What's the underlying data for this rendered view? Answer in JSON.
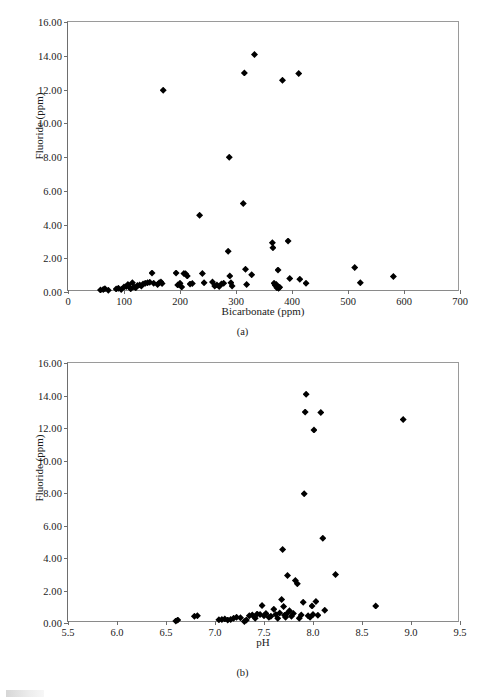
{
  "figure": {
    "panels": [
      {
        "id": "a",
        "caption": "(a)",
        "ylabel": "Fluoride (ppm)",
        "xlabel": "Bicarbonate (ppm)"
      },
      {
        "id": "b",
        "caption": "(b)",
        "ylabel": "Fluoride (ppm)",
        "xlabel": "pH"
      }
    ]
  },
  "chart_data": [
    {
      "type": "scatter",
      "panel": "a",
      "title": "",
      "xlabel": "Bicarbonate (ppm)",
      "ylabel": "Fluoride (ppm)",
      "xlim": [
        0,
        700
      ],
      "ylim": [
        0,
        16
      ],
      "xticks": [
        0,
        100,
        200,
        300,
        400,
        500,
        600,
        700
      ],
      "xtick_labels": [
        "0",
        "100",
        "200",
        "300",
        "400",
        "500",
        "600",
        "700"
      ],
      "yticks": [
        0,
        2,
        4,
        6,
        8,
        10,
        12,
        14,
        16
      ],
      "ytick_labels": [
        "0.00",
        "2.00",
        "4.00",
        "6.00",
        "8.00",
        "10.00",
        "12.00",
        "14.00",
        "16.00"
      ],
      "grid": false,
      "legend": false,
      "marker": "diamond",
      "marker_color": "#000000",
      "points": [
        [
          58,
          0.12
        ],
        [
          63,
          0.15
        ],
        [
          66,
          0.2
        ],
        [
          72,
          0.1
        ],
        [
          86,
          0.18
        ],
        [
          90,
          0.22
        ],
        [
          95,
          0.15
        ],
        [
          100,
          0.3
        ],
        [
          104,
          0.32
        ],
        [
          107,
          0.45
        ],
        [
          110,
          0.28
        ],
        [
          112,
          0.2
        ],
        [
          115,
          0.55
        ],
        [
          118,
          0.3
        ],
        [
          121,
          0.25
        ],
        [
          124,
          0.38
        ],
        [
          128,
          0.42
        ],
        [
          131,
          0.35
        ],
        [
          134,
          0.48
        ],
        [
          138,
          0.52
        ],
        [
          142,
          0.55
        ],
        [
          146,
          0.58
        ],
        [
          150,
          1.12
        ],
        [
          153,
          0.52
        ],
        [
          160,
          0.45
        ],
        [
          163,
          0.55
        ],
        [
          166,
          0.6
        ],
        [
          168,
          0.5
        ],
        [
          170,
          11.95
        ],
        [
          193,
          1.12
        ],
        [
          196,
          0.42
        ],
        [
          200,
          0.52
        ],
        [
          203,
          0.3
        ],
        [
          207,
          1.1
        ],
        [
          210,
          1.08
        ],
        [
          213,
          0.95
        ],
        [
          218,
          0.47
        ],
        [
          222,
          0.5
        ],
        [
          235,
          4.55
        ],
        [
          240,
          1.1
        ],
        [
          243,
          0.55
        ],
        [
          258,
          0.6
        ],
        [
          262,
          0.35
        ],
        [
          266,
          0.42
        ],
        [
          270,
          0.33
        ],
        [
          274,
          0.48
        ],
        [
          278,
          0.52
        ],
        [
          286,
          2.42
        ],
        [
          288,
          7.98
        ],
        [
          289,
          0.95
        ],
        [
          291,
          0.55
        ],
        [
          293,
          0.35
        ],
        [
          313,
          5.25
        ],
        [
          315,
          12.98
        ],
        [
          317,
          1.35
        ],
        [
          319,
          0.45
        ],
        [
          328,
          1.02
        ],
        [
          333,
          14.07
        ],
        [
          365,
          2.92
        ],
        [
          366,
          2.62
        ],
        [
          368,
          0.52
        ],
        [
          370,
          0.4
        ],
        [
          372,
          0.45
        ],
        [
          373,
          0.25
        ],
        [
          374,
          0.3
        ],
        [
          375,
          1.3
        ],
        [
          376,
          0.22
        ],
        [
          378,
          0.28
        ],
        [
          383,
          12.55
        ],
        [
          393,
          3.02
        ],
        [
          396,
          0.8
        ],
        [
          412,
          12.95
        ],
        [
          414,
          0.75
        ],
        [
          425,
          0.52
        ],
        [
          512,
          1.45
        ],
        [
          522,
          0.55
        ],
        [
          581,
          0.92
        ]
      ]
    },
    {
      "type": "scatter",
      "panel": "b",
      "title": "",
      "xlabel": "pH",
      "ylabel": "Fluoride (ppm)",
      "xlim": [
        5.5,
        9.5
      ],
      "ylim": [
        0,
        16
      ],
      "xticks": [
        5.5,
        6.0,
        6.5,
        7.0,
        7.5,
        8.0,
        8.5,
        9.0,
        9.5
      ],
      "xtick_labels": [
        "5.5",
        "6.0",
        "6.5",
        "7.0",
        "7.5",
        "8.0",
        "8.5",
        "9.0",
        "9.5"
      ],
      "yticks": [
        0,
        2,
        4,
        6,
        8,
        10,
        12,
        14,
        16
      ],
      "ytick_labels": [
        "0.00",
        "2.00",
        "4.00",
        "6.00",
        "8.00",
        "10.00",
        "12.00",
        "14.00",
        "16.00"
      ],
      "grid": false,
      "legend": false,
      "marker": "diamond",
      "marker_color": "#000000",
      "points": [
        [
          6.6,
          0.12
        ],
        [
          6.62,
          0.18
        ],
        [
          6.79,
          0.42
        ],
        [
          6.82,
          0.45
        ],
        [
          7.04,
          0.2
        ],
        [
          7.07,
          0.22
        ],
        [
          7.1,
          0.25
        ],
        [
          7.13,
          0.18
        ],
        [
          7.16,
          0.22
        ],
        [
          7.19,
          0.3
        ],
        [
          7.22,
          0.35
        ],
        [
          7.26,
          0.32
        ],
        [
          7.3,
          0.1
        ],
        [
          7.32,
          0.18
        ],
        [
          7.35,
          0.45
        ],
        [
          7.38,
          0.5
        ],
        [
          7.41,
          0.3
        ],
        [
          7.43,
          0.55
        ],
        [
          7.46,
          0.52
        ],
        [
          7.48,
          1.08
        ],
        [
          7.5,
          0.45
        ],
        [
          7.52,
          0.58
        ],
        [
          7.55,
          0.35
        ],
        [
          7.57,
          0.42
        ],
        [
          7.6,
          0.85
        ],
        [
          7.62,
          0.52
        ],
        [
          7.64,
          0.3
        ],
        [
          7.66,
          0.62
        ],
        [
          7.68,
          1.45
        ],
        [
          7.69,
          4.52
        ],
        [
          7.7,
          1.02
        ],
        [
          7.71,
          0.48
        ],
        [
          7.72,
          0.35
        ],
        [
          7.73,
          0.55
        ],
        [
          7.74,
          2.92
        ],
        [
          7.76,
          0.75
        ],
        [
          7.78,
          0.42
        ],
        [
          7.8,
          0.58
        ],
        [
          7.82,
          2.62
        ],
        [
          7.84,
          2.42
        ],
        [
          7.86,
          0.3
        ],
        [
          7.88,
          0.5
        ],
        [
          7.9,
          1.28
        ],
        [
          7.91,
          7.95
        ],
        [
          7.92,
          12.98
        ],
        [
          7.93,
          14.07
        ],
        [
          7.95,
          0.45
        ],
        [
          7.97,
          0.35
        ],
        [
          7.99,
          1.05
        ],
        [
          8.0,
          0.52
        ],
        [
          8.01,
          11.88
        ],
        [
          8.03,
          1.32
        ],
        [
          8.05,
          0.48
        ],
        [
          8.08,
          12.95
        ],
        [
          8.1,
          5.22
        ],
        [
          8.12,
          0.78
        ],
        [
          8.23,
          2.98
        ],
        [
          8.64,
          1.05
        ],
        [
          8.92,
          12.52
        ]
      ]
    }
  ]
}
